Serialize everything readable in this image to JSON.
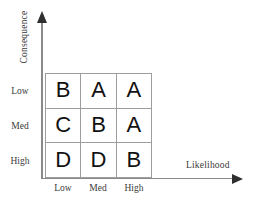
{
  "figure": {
    "name": "risk-assessment-matrix"
  },
  "axes": {
    "y_title": "Consequence",
    "x_title": "Likelihood",
    "y_tick_labels": [
      "Low",
      "Med",
      "High"
    ],
    "x_tick_labels": [
      "Low",
      "Med",
      "High"
    ],
    "y_arrow": "arrow-up-icon",
    "x_arrow": "arrow-right-icon",
    "axis_color": "#8a8a8a",
    "arrow_color": "#2f2f2f"
  },
  "matrix": {
    "grid_line_color": "#9d9d9d",
    "cell_text_color": "#111111",
    "rows": [
      {
        "row_label": "Low",
        "cells": [
          "B",
          "A",
          "A"
        ]
      },
      {
        "row_label": "Med",
        "cells": [
          "C",
          "B",
          "A"
        ]
      },
      {
        "row_label": "High",
        "cells": [
          "D",
          "D",
          "B"
        ]
      }
    ]
  },
  "chart_data": {
    "type": "heatmap",
    "title": "",
    "xlabel": "Likelihood",
    "ylabel": "Consequence",
    "x_categories": [
      "Low",
      "Med",
      "High"
    ],
    "y_categories": [
      "Low",
      "Med",
      "High"
    ],
    "cell_labels": [
      [
        "B",
        "A",
        "A"
      ],
      [
        "C",
        "B",
        "A"
      ],
      [
        "D",
        "D",
        "B"
      ]
    ],
    "grid": true,
    "legend": "none"
  }
}
